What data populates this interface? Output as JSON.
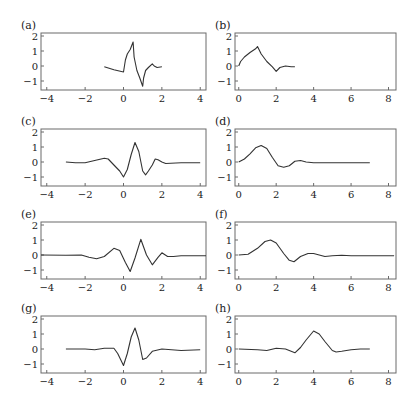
{
  "chart_data": [
    {
      "panel": "(a)",
      "type": "line",
      "xlim": [
        -4.3,
        4.3
      ],
      "ylim": [
        -1.6,
        2.2
      ],
      "xticks": [
        -4,
        -2,
        0,
        2,
        4
      ],
      "yticks": [
        2,
        1,
        0,
        -1
      ],
      "x": [
        -1.0,
        -0.5,
        0.0,
        0.1,
        0.2,
        0.35,
        0.5,
        0.55,
        0.7,
        0.85,
        1.0,
        1.05,
        1.15,
        1.3,
        1.5,
        1.6,
        1.75,
        2.0
      ],
      "y": [
        -0.05,
        -0.25,
        -0.4,
        0.4,
        0.8,
        1.1,
        1.6,
        0.6,
        -0.3,
        -0.8,
        -1.35,
        -0.8,
        -0.3,
        -0.1,
        0.15,
        0.0,
        -0.1,
        -0.05
      ]
    },
    {
      "panel": "(b)",
      "type": "line",
      "xlim": [
        -0.2,
        8.4
      ],
      "ylim": [
        -1.6,
        2.2
      ],
      "xticks": [
        0,
        2,
        4,
        6,
        8
      ],
      "yticks": [
        2,
        1,
        0,
        -1
      ],
      "x": [
        0.0,
        0.1,
        0.3,
        0.6,
        0.9,
        1.0,
        1.2,
        1.5,
        1.8,
        2.0,
        2.2,
        2.5,
        2.8,
        3.0
      ],
      "y": [
        0.0,
        0.3,
        0.6,
        0.9,
        1.15,
        1.3,
        0.8,
        0.3,
        -0.05,
        -0.35,
        -0.1,
        0.0,
        -0.05,
        -0.05
      ]
    },
    {
      "panel": "(c)",
      "type": "line",
      "xlim": [
        -4.3,
        4.3
      ],
      "ylim": [
        -1.6,
        2.2
      ],
      "xticks": [
        -4,
        -2,
        0,
        2,
        4
      ],
      "yticks": [
        2,
        1,
        0,
        -1
      ],
      "x": [
        -3.0,
        -2.5,
        -2.0,
        -1.5,
        -1.0,
        -0.8,
        -0.5,
        -0.2,
        0.0,
        0.2,
        0.4,
        0.6,
        0.8,
        1.0,
        1.15,
        1.3,
        1.5,
        1.65,
        1.8,
        2.0,
        2.2,
        3.0,
        4.0
      ],
      "y": [
        0.0,
        -0.05,
        -0.05,
        0.1,
        0.25,
        0.2,
        -0.2,
        -0.6,
        -1.0,
        -0.5,
        0.5,
        1.3,
        0.7,
        -0.6,
        -0.85,
        -0.6,
        -0.2,
        0.2,
        0.15,
        0.0,
        -0.1,
        -0.05,
        -0.05
      ]
    },
    {
      "panel": "(d)",
      "type": "line",
      "xlim": [
        -0.2,
        8.4
      ],
      "ylim": [
        -1.6,
        2.2
      ],
      "xticks": [
        0,
        2,
        4,
        6,
        8
      ],
      "yticks": [
        2,
        1,
        0,
        -1
      ],
      "x": [
        0.0,
        0.3,
        0.6,
        0.9,
        1.2,
        1.5,
        1.8,
        2.1,
        2.4,
        2.7,
        3.0,
        3.3,
        3.6,
        4.0,
        5.0,
        6.0,
        7.0
      ],
      "y": [
        0.0,
        0.2,
        0.55,
        0.95,
        1.1,
        0.9,
        0.3,
        -0.25,
        -0.35,
        -0.25,
        0.05,
        0.1,
        0.0,
        -0.05,
        -0.05,
        -0.05,
        -0.05
      ]
    },
    {
      "panel": "(e)",
      "type": "line",
      "xlim": [
        -4.3,
        4.3
      ],
      "ylim": [
        -1.6,
        2.2
      ],
      "xticks": [
        -4,
        -2,
        0,
        2,
        4
      ],
      "yticks": [
        2,
        1,
        0,
        -1
      ],
      "x": [
        -4.3,
        -3.0,
        -2.2,
        -1.8,
        -1.4,
        -1.0,
        -0.5,
        -0.2,
        0.1,
        0.35,
        0.6,
        0.9,
        1.2,
        1.5,
        1.8,
        2.0,
        2.3,
        2.6,
        3.0,
        4.3
      ],
      "y": [
        0.0,
        -0.02,
        0.0,
        -0.15,
        -0.25,
        -0.1,
        0.45,
        0.3,
        -0.5,
        -1.1,
        -0.2,
        1.05,
        0.0,
        -0.65,
        -0.15,
        0.15,
        -0.1,
        -0.1,
        -0.05,
        -0.05
      ]
    },
    {
      "panel": "(f)",
      "type": "line",
      "xlim": [
        -0.2,
        8.4
      ],
      "ylim": [
        -1.6,
        2.2
      ],
      "xticks": [
        0,
        2,
        4,
        6,
        8
      ],
      "yticks": [
        2,
        1,
        0,
        -1
      ],
      "x": [
        0.0,
        0.5,
        1.0,
        1.4,
        1.7,
        2.0,
        2.4,
        2.7,
        2.95,
        3.3,
        3.7,
        4.0,
        4.3,
        4.6,
        5.0,
        5.5,
        6.0,
        7.0,
        8.3
      ],
      "y": [
        0.0,
        0.05,
        0.45,
        0.9,
        1.0,
        0.8,
        0.1,
        -0.35,
        -0.45,
        -0.1,
        0.1,
        0.1,
        0.0,
        -0.1,
        -0.05,
        -0.02,
        -0.05,
        -0.05,
        -0.05
      ]
    },
    {
      "panel": "(g)",
      "type": "line",
      "xlim": [
        -4.3,
        4.3
      ],
      "ylim": [
        -1.6,
        2.2
      ],
      "xticks": [
        -4,
        -2,
        0,
        2,
        4
      ],
      "yticks": [
        2,
        1,
        0,
        -1
      ],
      "x": [
        -3.0,
        -2.0,
        -1.5,
        -1.0,
        -0.5,
        -0.3,
        0.0,
        0.2,
        0.4,
        0.6,
        0.8,
        1.0,
        1.2,
        1.5,
        2.0,
        2.5,
        3.0,
        4.0
      ],
      "y": [
        0.0,
        0.0,
        -0.05,
        0.05,
        0.05,
        -0.3,
        -1.1,
        -0.3,
        0.8,
        1.4,
        0.6,
        -0.7,
        -0.6,
        -0.15,
        0.0,
        -0.05,
        -0.1,
        -0.05
      ]
    },
    {
      "panel": "(h)",
      "type": "line",
      "xlim": [
        -0.2,
        8.4
      ],
      "ylim": [
        -1.6,
        2.2
      ],
      "xticks": [
        0,
        2,
        4,
        6,
        8
      ],
      "yticks": [
        2,
        1,
        0,
        -1
      ],
      "x": [
        0.0,
        1.0,
        1.5,
        2.0,
        2.5,
        3.0,
        3.3,
        3.6,
        4.0,
        4.3,
        4.6,
        5.0,
        5.2,
        5.5,
        6.0,
        6.5,
        7.0
      ],
      "y": [
        0.0,
        -0.05,
        -0.1,
        0.05,
        0.0,
        -0.25,
        0.1,
        0.6,
        1.2,
        1.0,
        0.5,
        -0.1,
        -0.2,
        -0.15,
        -0.05,
        0.0,
        0.0
      ]
    }
  ],
  "labels": {
    "a": "(a)",
    "b": "(b)",
    "c": "(c)",
    "d": "(d)",
    "e": "(e)",
    "f": "(f)",
    "g": "(g)",
    "h": "(h)"
  }
}
